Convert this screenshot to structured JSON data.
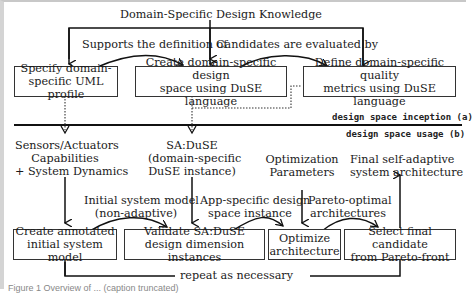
{
  "inception": {
    "source_label": "Domain-Specific Design Knowledge",
    "edge_supports": "Supports the definition of",
    "edge_evaluated": "Candidates are evaluated by",
    "box_uml": [
      "Specify domain-",
      "specific UML profile"
    ],
    "box_space": [
      "Create domain-specific design",
      "space using DuSE language"
    ],
    "box_metrics": [
      "Define domain-specific quality",
      "metrics using DuSE language"
    ],
    "phase_label": "design space inception (a)"
  },
  "usage": {
    "phase_label": "design space usage (b)",
    "input_sensors": [
      "Sensors/Actuators",
      "Capabilities",
      "+ System Dynamics"
    ],
    "input_saduse": [
      "SA:DuSE",
      "(domain-specific",
      "DuSE instance)"
    ],
    "input_optparams": [
      "Optimization",
      "Parameters"
    ],
    "output_final": [
      "Final self-adaptive",
      "system architecture"
    ],
    "edge_initial": [
      "Initial system model",
      "(non-adaptive)"
    ],
    "edge_appspecific": [
      "App-specific design",
      "space instance"
    ],
    "edge_pareto": [
      "Pareto-optimal",
      "architectures"
    ],
    "box_create": [
      "Create annotated",
      "initial system model"
    ],
    "box_validate": [
      "Validate SA:DuSE",
      "design dimension instances"
    ],
    "box_optimize": [
      "Optimize",
      "architecture"
    ],
    "box_select": [
      "Select final candidate",
      "from Pareto-front"
    ],
    "loop_label": "repeat as necessary"
  },
  "caption": "Figure 1 Overview of ... (caption truncated)"
}
